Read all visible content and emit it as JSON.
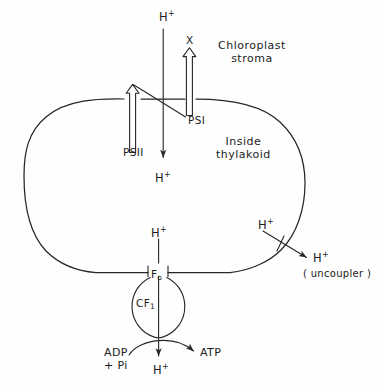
{
  "figure": {
    "background_color": "#fefefe",
    "ink_color": "#262626"
  },
  "regions": {
    "outside_label": "Chloroplast\nstroma",
    "outside_label_line1": "Chloroplast",
    "outside_label_line2": "stroma",
    "inside_label_line1": "Inside",
    "inside_label_line2": "thylakoid"
  },
  "complexes": [
    {
      "id": "psii",
      "label": "PSII",
      "label_base": "PS",
      "label_roman": "II",
      "style": "hatched-arrow",
      "direction": "up"
    },
    {
      "id": "psi",
      "label": "PSI",
      "label_base": "PS",
      "label_roman": "I",
      "style": "hatched-arrow",
      "direction": "up"
    },
    {
      "id": "atp-synthase",
      "channel_label": "F",
      "channel_subscript": "o",
      "head_label": "CF",
      "head_subscript": "1"
    }
  ],
  "electron_acceptor": {
    "label": "X"
  },
  "protons": {
    "top_stroma": "H",
    "top_stroma_charge": "+",
    "inside_upper": "H",
    "inside_upper_charge": "+",
    "inside_lower": "H",
    "inside_lower_charge": "+",
    "uncoupler_source": "H",
    "uncoupler_source_charge": "+",
    "uncoupler_target": "H",
    "uncoupler_target_charge": "+",
    "synthase_exit": "H",
    "synthase_exit_charge": "+"
  },
  "uncoupler": {
    "note": "( uncoupler )"
  },
  "phosphorylation": {
    "substrate_line1": "ADP",
    "substrate_line2": "+ Pi",
    "product": "ATP"
  }
}
